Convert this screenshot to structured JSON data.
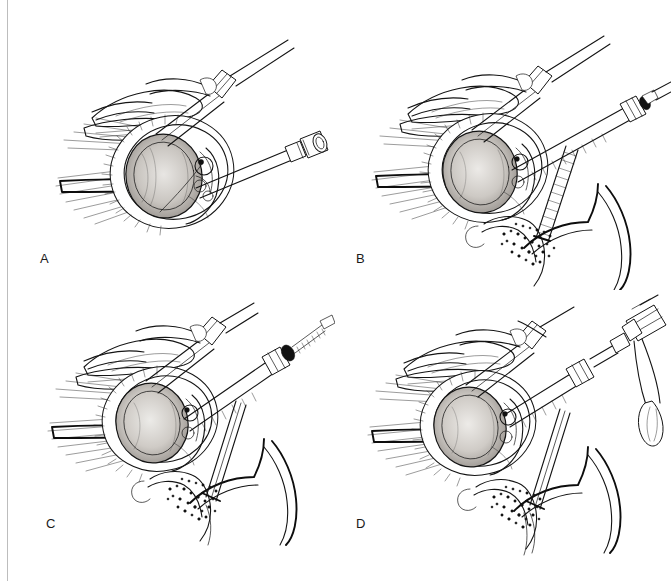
{
  "figure": {
    "kind": "surgical-technique-line-illustration",
    "background_color": "#ffffff",
    "ink_color": "#141414",
    "margin_rule_color": "#bdbdbd",
    "panel_count": 4,
    "panels": [
      {
        "id": "a",
        "label": "A",
        "caption_hidden": "Glenoid exposed with retractors; cannula and drill guide positioned",
        "elements": [
          "glenoid-fossa",
          "labrum-rim",
          "humeral-head-retractor",
          "soft-tissue-retractors",
          "angled-cannula-with-hub",
          "straight-drill-sleeve-tip"
        ]
      },
      {
        "id": "b",
        "label": "B",
        "caption_hidden": "Drill advanced through guide into glenoid; inset shows drill in bone cross section",
        "elements": [
          "glenoid-fossa",
          "labrum-rim",
          "humeral-head-retractor",
          "soft-tissue-retractors",
          "angled-cannula-with-hub",
          "drill-shaft-in-sleeve",
          "drill-chuck-hub",
          "bone-cross-section-inset",
          "cancellous-bone-stipple"
        ]
      },
      {
        "id": "c",
        "label": "C",
        "caption_hidden": "Threaded tap / screw advanced through the cannula; inset shows tapped bone tunnel",
        "elements": [
          "glenoid-fossa",
          "labrum-rim",
          "humeral-head-retractor",
          "soft-tissue-retractors",
          "angled-cannula-with-hub",
          "threaded-tap-shaft",
          "tap-hub",
          "bone-cross-section-inset",
          "cancellous-bone-stipple"
        ]
      },
      {
        "id": "d",
        "label": "D",
        "caption_hidden": "Anchor impacted with surgical mallet; inset shows seated implant",
        "elements": [
          "glenoid-fossa",
          "labrum-rim",
          "humeral-head-retractor",
          "soft-tissue-retractors",
          "angled-cannula-with-hub",
          "impactor-shaft",
          "surgical-mallet",
          "bone-cross-section-inset",
          "cancellous-bone-stipple"
        ]
      }
    ]
  }
}
